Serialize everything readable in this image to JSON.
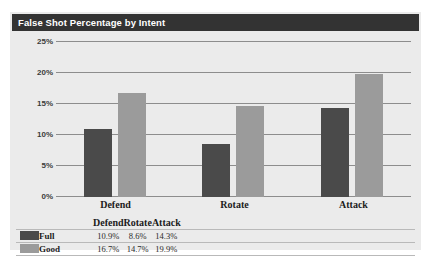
{
  "chart_data": {
    "type": "bar",
    "title": "False Shot Percentage by Intent",
    "xlabel": "",
    "ylabel": "",
    "categories": [
      "Defend",
      "Rotate",
      "Attack"
    ],
    "series": [
      {
        "name": "Full",
        "color": "#4a4a4a",
        "values": [
          10.9,
          16.7,
          14.3
        ],
        "value_labels": [
          "10.9%",
          "8.6%",
          "14.3%"
        ]
      },
      {
        "name": "Good",
        "color": "#9b9b9b",
        "values": [
          16.7,
          14.7,
          19.9
        ],
        "value_labels": [
          "16.7%",
          "14.7%",
          "19.9%"
        ]
      }
    ],
    "grouped_values": {
      "Defend": {
        "Full": 10.9,
        "Good": 16.7
      },
      "Rotate": {
        "Full": 8.6,
        "Good": 14.7
      },
      "Attack": {
        "Full": 14.3,
        "Good": 19.9
      }
    },
    "ylim": [
      0,
      25
    ],
    "ytick_values": [
      0,
      5,
      10,
      15,
      20,
      25
    ],
    "ytick_labels": [
      "0%",
      "5%",
      "10%",
      "15%",
      "20%",
      "25%"
    ],
    "grid": true,
    "legend_position": "bottom-table",
    "units": "percent"
  },
  "table": {
    "corner_label": "",
    "column_headers": [
      "Defend",
      "Rotate",
      "Attack"
    ],
    "rows": [
      {
        "series": "Full",
        "swatch_color": "#4a4a4a",
        "cells": [
          "10.9%",
          "8.6%",
          "14.3%"
        ]
      },
      {
        "series": "Good",
        "swatch_color": "#9b9b9b",
        "cells": [
          "16.7%",
          "14.7%",
          "19.9%"
        ]
      }
    ]
  },
  "colors": {
    "title_bar": "#333333",
    "title_text": "#ffffff",
    "panel_background": "#ebebeb",
    "gridline": "#8d8d8d",
    "series_full": "#4a4a4a",
    "series_good": "#9b9b9b"
  }
}
